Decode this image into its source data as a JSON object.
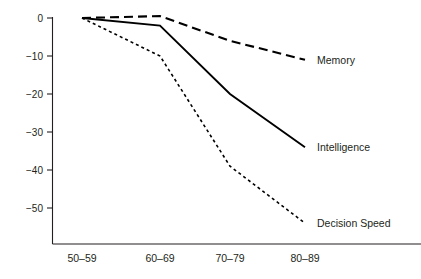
{
  "chart_data": {
    "type": "line",
    "title": "",
    "xlabel": "",
    "ylabel": "",
    "categories": [
      "50–59",
      "60–69",
      "70–79",
      "80–89"
    ],
    "yticks": [
      0,
      -10,
      -20,
      -30,
      -40,
      -50
    ],
    "ytick_labels": [
      "0",
      "−10",
      "−20",
      "−30",
      "−40",
      "−50"
    ],
    "ylim": [
      -57,
      2
    ],
    "grid": false,
    "legend_position": "inline-right",
    "series": [
      {
        "name": "Memory",
        "values": [
          0,
          0.5,
          -6,
          -11
        ],
        "style": "dashed",
        "color": "#000000",
        "dash": "9 5",
        "width": 2.1
      },
      {
        "name": "Intelligence",
        "values": [
          0,
          -2,
          -20,
          -34
        ],
        "style": "solid",
        "color": "#000000",
        "dash": "none",
        "width": 1.9
      },
      {
        "name": "Decision Speed",
        "values": [
          0,
          -10,
          -39,
          -54
        ],
        "style": "dotted",
        "color": "#000000",
        "dash": "3 3",
        "width": 1.6
      }
    ]
  }
}
